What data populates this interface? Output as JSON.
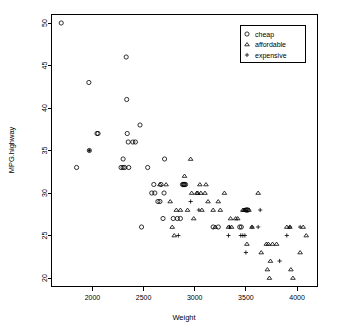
{
  "chart_data": {
    "type": "scatter",
    "title": "",
    "xlabel": "Weight",
    "ylabel": "MPG.highway",
    "xlim": [
      1600,
      4200
    ],
    "ylim": [
      19,
      51
    ],
    "xticks": [
      2000,
      2500,
      3000,
      3500,
      4000
    ],
    "yticks": [
      20,
      25,
      30,
      35,
      40,
      45,
      50
    ],
    "grid": false,
    "legend_position": "top-right",
    "legend": [
      {
        "label": "cheap",
        "marker": "circle"
      },
      {
        "label": "affordable",
        "marker": "triangle"
      },
      {
        "label": "expensive",
        "marker": "plus"
      }
    ],
    "series": [
      {
        "name": "cheap",
        "marker": "circle",
        "points": [
          [
            1695,
            50
          ],
          [
            1845,
            33
          ],
          [
            1965,
            43
          ],
          [
            1970,
            35
          ],
          [
            2045,
            37
          ],
          [
            2055,
            37
          ],
          [
            2280,
            33
          ],
          [
            2300,
            34
          ],
          [
            2300,
            33
          ],
          [
            2315,
            33
          ],
          [
            2330,
            46
          ],
          [
            2335,
            41
          ],
          [
            2340,
            37
          ],
          [
            2350,
            36
          ],
          [
            2355,
            33
          ],
          [
            2395,
            36
          ],
          [
            2420,
            36
          ],
          [
            2465,
            38
          ],
          [
            2480,
            26
          ],
          [
            2540,
            33
          ],
          [
            2580,
            30
          ],
          [
            2600,
            31
          ],
          [
            2610,
            30
          ],
          [
            2640,
            29
          ],
          [
            2660,
            29
          ],
          [
            2670,
            31
          ],
          [
            2690,
            27
          ],
          [
            2700,
            30
          ],
          [
            2705,
            34
          ],
          [
            2790,
            27
          ],
          [
            2830,
            27
          ],
          [
            2860,
            27
          ],
          [
            2880,
            31
          ],
          [
            2890,
            31
          ],
          [
            2895,
            31
          ],
          [
            2900,
            31
          ],
          [
            2910,
            31
          ],
          [
            3180,
            26
          ],
          [
            3230,
            26
          ],
          [
            3440,
            26
          ],
          [
            3455,
            26
          ],
          [
            3500,
            28
          ],
          [
            3510,
            28
          ],
          [
            3520,
            28
          ]
        ]
      },
      {
        "name": "affordable",
        "marker": "triangle",
        "points": [
          [
            2660,
            31
          ],
          [
            2720,
            31
          ],
          [
            2760,
            29
          ],
          [
            2780,
            26
          ],
          [
            2800,
            25
          ],
          [
            2820,
            28
          ],
          [
            2860,
            28
          ],
          [
            2900,
            32
          ],
          [
            2930,
            28
          ],
          [
            2960,
            34
          ],
          [
            2970,
            30
          ],
          [
            2990,
            27
          ],
          [
            3020,
            30
          ],
          [
            3030,
            30
          ],
          [
            3050,
            31
          ],
          [
            3060,
            30
          ],
          [
            3070,
            28
          ],
          [
            3100,
            30
          ],
          [
            3110,
            31
          ],
          [
            3130,
            29
          ],
          [
            3180,
            28
          ],
          [
            3200,
            26
          ],
          [
            3230,
            29
          ],
          [
            3250,
            28
          ],
          [
            3290,
            30
          ],
          [
            3330,
            26
          ],
          [
            3350,
            27
          ],
          [
            3360,
            26
          ],
          [
            3400,
            27
          ],
          [
            3420,
            27
          ],
          [
            3470,
            28
          ],
          [
            3480,
            28
          ],
          [
            3490,
            28
          ],
          [
            3500,
            28
          ],
          [
            3510,
            24
          ],
          [
            3530,
            28
          ],
          [
            3560,
            26
          ],
          [
            3620,
            30
          ],
          [
            3650,
            23
          ],
          [
            3700,
            24
          ],
          [
            3710,
            21
          ],
          [
            3720,
            24
          ],
          [
            3730,
            20
          ],
          [
            3740,
            22
          ],
          [
            3760,
            24
          ],
          [
            3800,
            24
          ],
          [
            3900,
            26
          ],
          [
            3930,
            26
          ],
          [
            3940,
            21
          ],
          [
            3960,
            20
          ],
          [
            4030,
            23
          ],
          [
            4060,
            26
          ],
          [
            4090,
            25
          ]
        ]
      },
      {
        "name": "expensive",
        "marker": "plus",
        "points": [
          [
            2840,
            25
          ],
          [
            2960,
            29
          ],
          [
            3040,
            28
          ],
          [
            3330,
            25
          ],
          [
            3340,
            26
          ],
          [
            3450,
            25
          ],
          [
            3470,
            25
          ],
          [
            3490,
            25
          ],
          [
            3500,
            23
          ],
          [
            3560,
            26
          ],
          [
            3620,
            26
          ],
          [
            3640,
            28
          ],
          [
            3830,
            22
          ],
          [
            3900,
            25
          ],
          [
            3930,
            26
          ],
          [
            4030,
            26
          ]
        ]
      }
    ]
  },
  "colors": {
    "foreground": "#000000",
    "background": "#ffffff"
  }
}
